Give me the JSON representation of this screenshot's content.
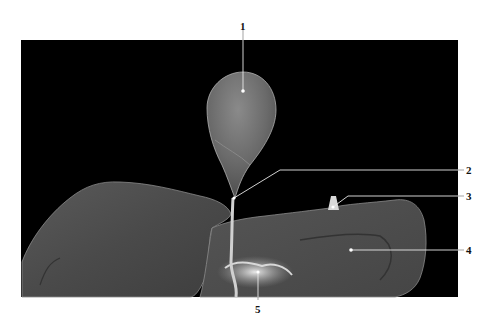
{
  "figure": {
    "background_color": "#000000",
    "page_color": "#ffffff",
    "labels": [
      {
        "id": "1",
        "text": "1",
        "x": 243,
        "y": 20
      },
      {
        "id": "2",
        "text": "2",
        "x": 469,
        "y": 166
      },
      {
        "id": "3",
        "text": "3",
        "x": 469,
        "y": 192
      },
      {
        "id": "4",
        "text": "4",
        "x": 469,
        "y": 246
      },
      {
        "id": "5",
        "text": "5",
        "x": 254,
        "y": 304
      }
    ]
  }
}
